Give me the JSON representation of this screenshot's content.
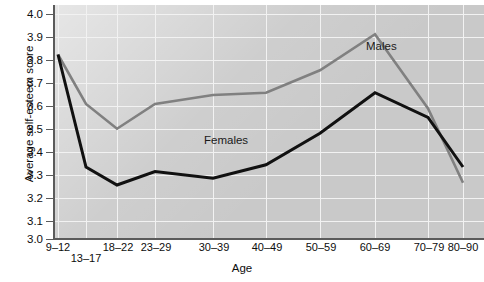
{
  "chart_data": {
    "type": "line",
    "title": "",
    "xlabel": "Age",
    "ylabel": "Average self-esteem score",
    "categories": [
      "9–12",
      "13–17",
      "18–22",
      "23–29",
      "30–39",
      "40–49",
      "50–59",
      "60–69",
      "70–79",
      "80–90"
    ],
    "ylim": [
      3.0,
      4.0
    ],
    "ytick_labels": [
      "3.0",
      "3.1",
      "3.2",
      "3.3",
      "3.4",
      "3.5",
      "3.6",
      "3.7",
      "3.8",
      "3.9",
      "4.0"
    ],
    "ytick_values": [
      3.0,
      3.1,
      3.2,
      3.3,
      3.4,
      3.5,
      3.6,
      3.7,
      3.8,
      3.9,
      4.0
    ],
    "grid": true,
    "legend_position": "inline-annotation",
    "series": [
      {
        "name": "Males",
        "color": "#808080",
        "values": [
          3.82,
          3.6,
          3.49,
          3.6,
          3.64,
          3.65,
          3.75,
          3.91,
          3.58,
          3.25
        ]
      },
      {
        "name": "Females",
        "color": "#111111",
        "values": [
          3.82,
          3.32,
          3.24,
          3.3,
          3.27,
          3.33,
          3.47,
          3.65,
          3.54,
          3.32
        ]
      }
    ],
    "annotations": [
      {
        "text": "Males",
        "x_category": "60–69",
        "value": 3.88
      },
      {
        "text": "Females",
        "x_category": "40–49",
        "value": 3.43
      }
    ]
  },
  "axis": {
    "y_title": "Average self-esteem score",
    "x_title": "Age"
  }
}
